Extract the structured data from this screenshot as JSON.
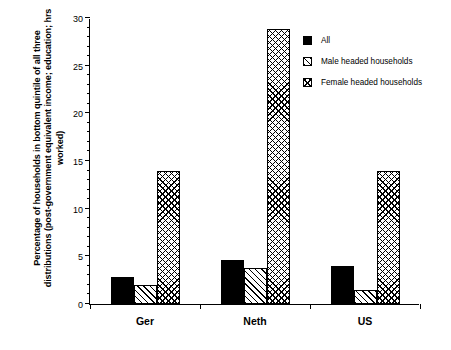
{
  "chart_data": {
    "type": "bar",
    "title": "",
    "subtitle": "",
    "xlabel": "",
    "ylabel": "Percentage of households in bottom quintile of all three distributions (post-government equivalent income; education; hrs worked)",
    "categories": [
      "Ger",
      "Neth",
      "US"
    ],
    "series": [
      {
        "name": "All",
        "values": [
          2.8,
          4.6,
          4.0
        ],
        "fill": "solid-black"
      },
      {
        "name": "Male headed households",
        "values": [
          2.0,
          3.8,
          1.5
        ],
        "fill": "diagonal-hatch"
      },
      {
        "name": "Female headed households",
        "values": [
          14.0,
          28.8,
          14.0
        ],
        "fill": "cross-hatch"
      }
    ],
    "ylim": [
      0,
      30
    ],
    "ytick_labels": [
      "0",
      "5",
      "10",
      "15",
      "20",
      "25",
      "30"
    ],
    "ytick_values": [
      0,
      5,
      10,
      15,
      20,
      25,
      30
    ],
    "yminor_interval": 1,
    "grid": false,
    "legend_position": "top-right",
    "colors": {
      "axis": "#000000",
      "background": "#ffffff",
      "bar_outline": "#000000",
      "bar_solid": "#000000"
    }
  },
  "legend": {
    "items": [
      {
        "label": "All",
        "swatch": "solid-black-swatch"
      },
      {
        "label": "Male headed households",
        "swatch": "diagonal-hatch-swatch"
      },
      {
        "label": "Female headed households",
        "swatch": "cross-hatch-swatch"
      }
    ]
  },
  "axes": {
    "y_title": "Percentage of households in bottom quintile of all three distributions (post-government equivalent income; education; hrs worked)",
    "y_ticks": [
      "30",
      "25",
      "20",
      "15",
      "10",
      "5",
      "0"
    ],
    "x_ticks": [
      "Ger",
      "Neth",
      "US"
    ]
  }
}
